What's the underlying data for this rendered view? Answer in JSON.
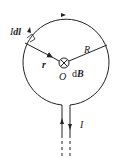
{
  "diagram": {
    "type": "circular current loop, Biot-Savart element",
    "labels": {
      "current_element_I": "I",
      "current_element_dl": "dl",
      "radius_vector": "r",
      "radius": "R",
      "center": "O",
      "field_element": "dB",
      "field_element_d": "d",
      "field_element_B": "B",
      "current": "I"
    },
    "symbols": {
      "field_direction": "into-page (⊗)"
    },
    "colors": {
      "stroke": "#222222",
      "background": "#ffffff"
    }
  }
}
